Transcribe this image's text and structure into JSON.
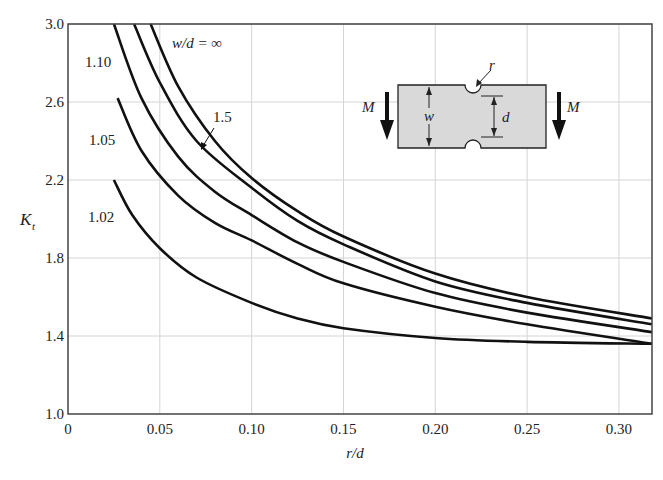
{
  "chart_data": {
    "type": "line",
    "title": "",
    "xlabel": "r/d",
    "ylabel": "K_t",
    "ylabel_main": "K",
    "ylabel_sub": "t",
    "xlim": [
      0,
      0.318
    ],
    "ylim": [
      1.0,
      3.0
    ],
    "grid": true,
    "x_ticks": [
      0,
      0.05,
      0.1,
      0.15,
      0.2,
      0.25,
      0.3
    ],
    "x_tick_labels": [
      "0",
      "0.05",
      "0.10",
      "0.15",
      "0.20",
      "0.25",
      "0.30"
    ],
    "y_ticks": [
      1.0,
      1.4,
      1.8,
      2.2,
      2.6,
      3.0
    ],
    "y_tick_labels": [
      "1.0",
      "1.4",
      "1.8",
      "2.2",
      "2.6",
      "3.0"
    ],
    "series": [
      {
        "name": "w/d = ∞",
        "label": "w/d = ∞",
        "x": [
          0.045,
          0.06,
          0.08,
          0.1,
          0.125,
          0.15,
          0.2,
          0.25,
          0.318
        ],
        "y": [
          3.0,
          2.68,
          2.4,
          2.21,
          2.04,
          1.91,
          1.72,
          1.6,
          1.49
        ]
      },
      {
        "name": "1.5",
        "label": "1.5",
        "x": [
          0.036,
          0.05,
          0.07,
          0.1,
          0.125,
          0.15,
          0.2,
          0.25,
          0.318
        ],
        "y": [
          3.0,
          2.7,
          2.4,
          2.16,
          1.99,
          1.87,
          1.68,
          1.57,
          1.46
        ]
      },
      {
        "name": "1.10",
        "label": "1.10",
        "x": [
          0.025,
          0.04,
          0.06,
          0.08,
          0.1,
          0.125,
          0.15,
          0.2,
          0.25,
          0.318
        ],
        "y": [
          3.0,
          2.62,
          2.32,
          2.14,
          2.02,
          1.88,
          1.78,
          1.62,
          1.52,
          1.42
        ]
      },
      {
        "name": "1.05",
        "label": "1.05",
        "x": [
          0.027,
          0.04,
          0.06,
          0.08,
          0.1,
          0.125,
          0.15,
          0.2,
          0.25,
          0.318
        ],
        "y": [
          2.62,
          2.35,
          2.12,
          1.98,
          1.89,
          1.77,
          1.67,
          1.55,
          1.46,
          1.36
        ]
      },
      {
        "name": "1.02",
        "label": "1.02",
        "x": [
          0.025,
          0.035,
          0.05,
          0.07,
          0.1,
          0.125,
          0.15,
          0.2,
          0.25,
          0.318
        ],
        "y": [
          2.2,
          2.02,
          1.85,
          1.7,
          1.57,
          1.49,
          1.44,
          1.39,
          1.37,
          1.36
        ]
      }
    ],
    "annotations": {
      "inf_label": "w/d = ∞",
      "label_15": "1.5",
      "label_110": "1.10",
      "label_105": "1.05",
      "label_102": "1.02"
    },
    "inset": {
      "moment_label": "M",
      "width_label": "w",
      "depth_label": "d",
      "radius_label": "r",
      "plate_color": "#d9d9d9"
    }
  }
}
